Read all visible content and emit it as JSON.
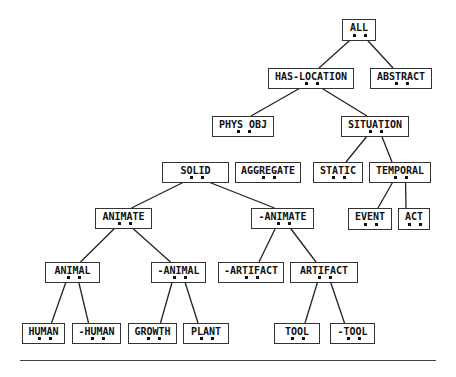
{
  "diagram": {
    "type": "hierarchy-tree",
    "nodes": [
      {
        "id": "all",
        "label": "ALL",
        "x": 342,
        "y": 19,
        "w": 34,
        "h": 22,
        "parent": null
      },
      {
        "id": "has_location",
        "label": "HAS-LOCATION",
        "x": 268,
        "y": 68,
        "w": 86,
        "h": 21,
        "parent": "all"
      },
      {
        "id": "abstract",
        "label": "ABSTRACT",
        "x": 370,
        "y": 68,
        "w": 62,
        "h": 21,
        "parent": "all"
      },
      {
        "id": "phys_obj",
        "label": "PHYS OBJ",
        "x": 212,
        "y": 116,
        "w": 62,
        "h": 21,
        "parent": "has_location"
      },
      {
        "id": "situation",
        "label": "SITUATION",
        "x": 341,
        "y": 116,
        "w": 68,
        "h": 21,
        "parent": "has_location"
      },
      {
        "id": "solid",
        "label": "SOLID",
        "x": 162,
        "y": 162,
        "w": 67,
        "h": 21,
        "parent": null
      },
      {
        "id": "aggregate",
        "label": "AGGREGATE",
        "x": 235,
        "y": 162,
        "w": 66,
        "h": 21,
        "parent": null
      },
      {
        "id": "static",
        "label": "STATIC",
        "x": 313,
        "y": 162,
        "w": 50,
        "h": 21,
        "parent": "situation"
      },
      {
        "id": "temporal",
        "label": "TEMPORAL",
        "x": 369,
        "y": 162,
        "w": 62,
        "h": 21,
        "parent": "situation"
      },
      {
        "id": "animate",
        "label": "ANIMATE",
        "x": 95,
        "y": 208,
        "w": 57,
        "h": 21,
        "parent": "solid"
      },
      {
        "id": "neg_animate",
        "label": "-ANIMATE",
        "x": 251,
        "y": 208,
        "w": 63,
        "h": 21,
        "parent": "solid"
      },
      {
        "id": "event",
        "label": "EVENT",
        "x": 348,
        "y": 208,
        "w": 44,
        "h": 22,
        "parent": "temporal"
      },
      {
        "id": "act",
        "label": "ACT",
        "x": 398,
        "y": 208,
        "w": 32,
        "h": 22,
        "parent": "temporal"
      },
      {
        "id": "animal",
        "label": "ANIMAL",
        "x": 45,
        "y": 262,
        "w": 55,
        "h": 21,
        "parent": "animate"
      },
      {
        "id": "neg_animal",
        "label": "-ANIMAL",
        "x": 151,
        "y": 262,
        "w": 55,
        "h": 21,
        "parent": "animate"
      },
      {
        "id": "neg_artifact",
        "label": "-ARTIFACT",
        "x": 218,
        "y": 262,
        "w": 66,
        "h": 21,
        "parent": "neg_animate"
      },
      {
        "id": "artifact",
        "label": "ARTIFACT",
        "x": 290,
        "y": 262,
        "w": 68,
        "h": 21,
        "parent": "neg_animate"
      },
      {
        "id": "human",
        "label": "HUMAN",
        "x": 22,
        "y": 323,
        "w": 43,
        "h": 21,
        "parent": "animal"
      },
      {
        "id": "neg_human",
        "label": "-HUMAN",
        "x": 72,
        "y": 323,
        "w": 49,
        "h": 21,
        "parent": "animal"
      },
      {
        "id": "growth",
        "label": "GROWTH",
        "x": 128,
        "y": 323,
        "w": 49,
        "h": 21,
        "parent": "neg_animal"
      },
      {
        "id": "plant",
        "label": "PLANT",
        "x": 183,
        "y": 323,
        "w": 46,
        "h": 21,
        "parent": "neg_animal"
      },
      {
        "id": "tool",
        "label": "TOOL",
        "x": 274,
        "y": 323,
        "w": 46,
        "h": 21,
        "parent": "artifact"
      },
      {
        "id": "neg_tool",
        "label": "-TOOL",
        "x": 330,
        "y": 323,
        "w": 45,
        "h": 21,
        "parent": "artifact"
      }
    ],
    "colors": {
      "line": "#222222",
      "box_border": "#333333",
      "text": "#111111",
      "background": "#ffffff"
    }
  }
}
